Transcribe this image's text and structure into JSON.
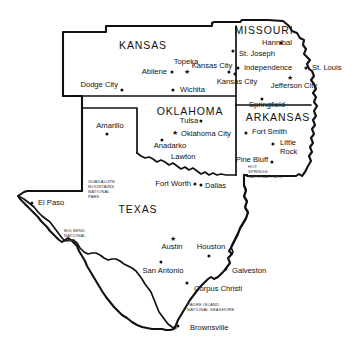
{
  "map": {
    "title": "Map of Texas, Oklahoma, Kansas, Missouri and Arkansas",
    "colors": {
      "background": "#ffffff",
      "outline": "#111111",
      "park_text": "#333333"
    },
    "states": [
      {
        "name": "KANSAS",
        "x": 143,
        "y": 45
      },
      {
        "name": "MISSOURI",
        "x": 264,
        "y": 30
      },
      {
        "name": "OKLAHOMA",
        "x": 190,
        "y": 111
      },
      {
        "name": "ARKANSAS",
        "x": 278,
        "y": 117
      },
      {
        "name": "TEXAS",
        "x": 138,
        "y": 209
      }
    ],
    "cities": [
      {
        "label": "Dodge City",
        "x": 118,
        "y": 85,
        "anchor": "end",
        "marker": "dot",
        "dot_x": 122,
        "dot_y": 90
      },
      {
        "label": "Abilene",
        "x": 167,
        "y": 72,
        "anchor": "end",
        "marker": "dot",
        "dot_x": 172,
        "dot_y": 72
      },
      {
        "label": "Topeka",
        "x": 186,
        "y": 62,
        "anchor": "mid",
        "marker": "star",
        "dot_x": 187,
        "dot_y": 71
      },
      {
        "label": "Kansas City",
        "x": 212,
        "y": 66,
        "anchor": "mid",
        "marker": "dot",
        "dot_x": 229,
        "dot_y": 72
      },
      {
        "label": "Wichita",
        "x": 180,
        "y": 90,
        "anchor": "start",
        "marker": "dot",
        "dot_x": 173,
        "dot_y": 90
      },
      {
        "label": "Hannibal",
        "x": 277,
        "y": 43,
        "anchor": "mid",
        "marker": "dot",
        "dot_x": 281,
        "dot_y": 43
      },
      {
        "label": "St. Joseph",
        "x": 239,
        "y": 54,
        "anchor": "start",
        "marker": "dot",
        "dot_x": 233,
        "dot_y": 51
      },
      {
        "label": "Independence",
        "x": 244,
        "y": 68,
        "anchor": "start",
        "marker": "dot",
        "dot_x": 238,
        "dot_y": 68
      },
      {
        "label": "St. Louis",
        "x": 312,
        "y": 68,
        "anchor": "start",
        "marker": "dot",
        "dot_x": 306,
        "dot_y": 68
      },
      {
        "label": "Kansas City",
        "x": 237,
        "y": 82,
        "anchor": "mid",
        "marker": "dot",
        "dot_x": 235,
        "dot_y": 74
      },
      {
        "label": "Jefferson City",
        "x": 294,
        "y": 86,
        "anchor": "mid",
        "marker": "star",
        "dot_x": 290,
        "dot_y": 77
      },
      {
        "label": "Springfield",
        "x": 267,
        "y": 105,
        "anchor": "mid",
        "marker": "dot",
        "dot_x": 262,
        "dot_y": 99
      },
      {
        "label": "Tulsa",
        "x": 189,
        "y": 121,
        "anchor": "mid",
        "marker": "dot",
        "dot_x": 201,
        "dot_y": 121
      },
      {
        "label": "Oklahoma City",
        "x": 181,
        "y": 134,
        "anchor": "start",
        "marker": "star",
        "dot_x": 175,
        "dot_y": 132
      },
      {
        "label": "Anadarko",
        "x": 170,
        "y": 146,
        "anchor": "mid",
        "marker": "dot",
        "dot_x": 162,
        "dot_y": 140
      },
      {
        "label": "Lawton",
        "x": 171,
        "y": 157,
        "anchor": "start",
        "marker": "dot',  ",
        "dot_x": 165,
        "dot_y": 157
      },
      {
        "label": "Fort Smith",
        "x": 252,
        "y": 132,
        "anchor": "start",
        "marker": "dot",
        "dot_x": 246,
        "dot_y": 133
      },
      {
        "label": "Little",
        "x": 280,
        "y": 143,
        "anchor": "start",
        "marker": "dot",
        "dot_x": 273,
        "dot_y": 144
      },
      {
        "label": "Rock",
        "x": 280,
        "y": 152,
        "anchor": "start",
        "marker": "none",
        "dot_x": 0,
        "dot_y": 0
      },
      {
        "label": "Pine Bluff",
        "x": 268,
        "y": 160,
        "anchor": "end",
        "marker": "dot",
        "dot_x": 272,
        "dot_y": 162
      },
      {
        "label": "Amarillo",
        "x": 110,
        "y": 126,
        "anchor": "mid",
        "marker": "dot",
        "dot_x": 107,
        "dot_y": 134
      },
      {
        "label": "El Paso",
        "x": 38,
        "y": 203,
        "anchor": "start",
        "marker": "dot",
        "dot_x": 32,
        "dot_y": 203
      },
      {
        "label": "Fort Worth",
        "x": 191,
        "y": 184,
        "anchor": "end",
        "marker": "dot",
        "dot_x": 195,
        "dot_y": 184
      },
      {
        "label": "Dallas",
        "x": 205,
        "y": 186,
        "anchor": "start",
        "marker": "dot",
        "dot_x": 201,
        "dot_y": 185
      },
      {
        "label": "Austin",
        "x": 172,
        "y": 247,
        "anchor": "mid",
        "marker": "star",
        "dot_x": 173,
        "dot_y": 238
      },
      {
        "label": "Houston",
        "x": 211,
        "y": 247,
        "anchor": "mid",
        "marker": "dot",
        "dot_x": 209,
        "dot_y": 256
      },
      {
        "label": "San Antonio",
        "x": 163,
        "y": 271,
        "anchor": "mid",
        "marker": "dot",
        "dot_x": 161,
        "dot_y": 262
      },
      {
        "label": "Galveston",
        "x": 232,
        "y": 271,
        "anchor": "start",
        "marker": "dot",
        "dot_x": 226,
        "dot_y": 269
      },
      {
        "label": "Corpus Christi",
        "x": 194,
        "y": 289,
        "anchor": "start",
        "marker": "dot",
        "dot_x": 187,
        "dot_y": 283
      },
      {
        "label": "Brownsville",
        "x": 190,
        "y": 328,
        "anchor": "start",
        "marker": "dot",
        "dot_x": 178,
        "dot_y": 326
      }
    ],
    "parks": [
      {
        "lines": [
          "GUADALUPE",
          "MOUNTAINS",
          "NATIONAL",
          "PARK"
        ],
        "x": 88,
        "y": 190,
        "anchor": "start"
      },
      {
        "lines": [
          "BIG BEND",
          "NATIONAL",
          "PARK"
        ],
        "x": 64,
        "y": 236,
        "anchor": "start"
      },
      {
        "lines": [
          "HOT",
          "SPRINGS",
          "NATIONAL PARK"
        ],
        "x": 248,
        "y": 172,
        "anchor": "start"
      },
      {
        "lines": [
          "PADRE ISLAND",
          "NATIONAL SEASHORE"
        ],
        "x": 187,
        "y": 308,
        "anchor": "start"
      }
    ]
  }
}
